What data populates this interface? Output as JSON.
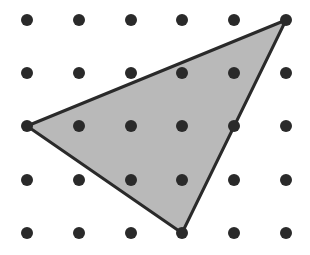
{
  "figure": {
    "width": 310,
    "height": 255,
    "grid": {
      "columns": 6,
      "rows": 5,
      "x_positions": [
        27,
        79,
        131,
        182,
        234,
        286
      ],
      "y_positions": [
        20,
        73,
        126,
        180,
        233
      ],
      "dot_radius": 6,
      "dot_color": "#2a2a2a"
    },
    "triangle": {
      "vertices_grid": [
        [
          0,
          2
        ],
        [
          5,
          0
        ],
        [
          3,
          4
        ]
      ],
      "fill_color": "#b9b9b9",
      "stroke_color": "#2a2a2a",
      "stroke_width": 3
    }
  }
}
